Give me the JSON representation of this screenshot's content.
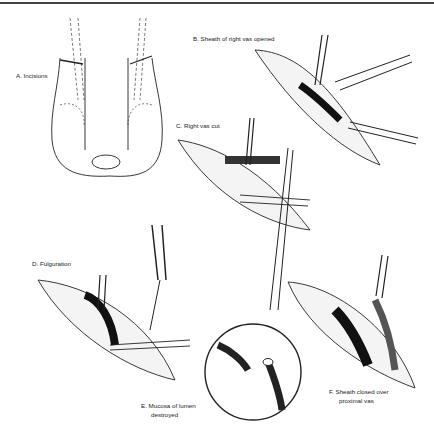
{
  "figure": {
    "panels": [
      {
        "id": "A",
        "label": "A. Incisions"
      },
      {
        "id": "B",
        "label": "B. Sheath of right vas opened"
      },
      {
        "id": "C",
        "label": "C. Right vas cut"
      },
      {
        "id": "D",
        "label": "D. Fulguration"
      },
      {
        "id": "E",
        "label_line1": "E. Mucosa of lumen",
        "label_line2": "destroyed"
      },
      {
        "id": "F",
        "label_line1": "F. Sheath closed over",
        "label_line2": "proximal vas"
      }
    ]
  }
}
